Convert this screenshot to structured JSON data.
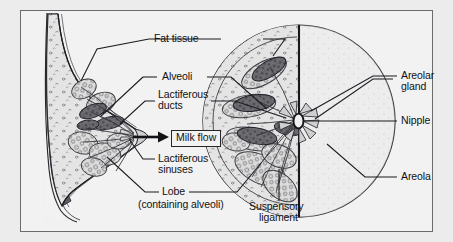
{
  "figure": {
    "background_color": "#f2f2f2",
    "page_color": "#ececed",
    "border_color": "#6b6b70",
    "ink_color": "#111113"
  },
  "labels": {
    "fat_tissue": "Fat tissue",
    "alveoli": "Alveoli",
    "lactiferous_ducts_line1": "Lactiferous",
    "lactiferous_ducts_line2": "ducts",
    "milk_flow": "Milk flow",
    "lactiferous_sinuses_line1": "Lactiferous",
    "lactiferous_sinuses_line2": "sinuses",
    "lobe": "Lobe",
    "lobe_sub": "(containing alveoli)",
    "suspensory_line1": "Suspensory",
    "suspensory_line2": "ligament",
    "areolar_gland_line1": "Areolar",
    "areolar_gland_line2": "gland",
    "nipple": "Nipple",
    "areola": "Areola"
  },
  "views": {
    "sagittal": {
      "name": "sagittal cross-section of breast on chest wall",
      "structures": [
        "chest wall",
        "pectoral muscle",
        "fat tissue",
        "lobe",
        "alveoli",
        "lactiferous ducts",
        "lactiferous sinuses",
        "nipple"
      ]
    },
    "frontal": {
      "name": "frontal circular view of breast",
      "structures": [
        "lobe",
        "alveoli",
        "lactiferous ducts",
        "suspensory ligament",
        "areolar gland",
        "nipple",
        "areola"
      ]
    }
  }
}
